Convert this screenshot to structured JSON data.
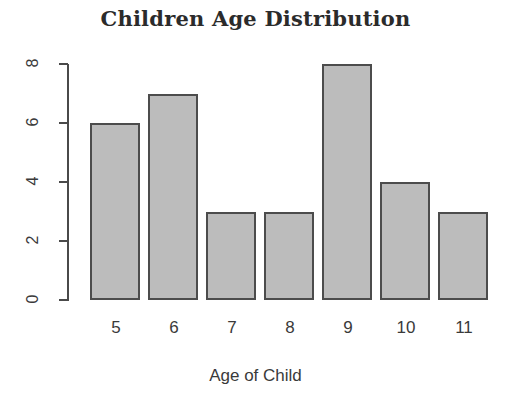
{
  "chart_data": {
    "type": "bar",
    "title": "Children Age Distribution",
    "xlabel": "Age of Child",
    "ylabel": "",
    "categories": [
      "5",
      "6",
      "7",
      "8",
      "9",
      "10",
      "11"
    ],
    "values": [
      6,
      7,
      3,
      3,
      8,
      4,
      3
    ],
    "ylim": [
      0,
      8
    ],
    "y_ticks": [
      "0",
      "2",
      "4",
      "6",
      "8"
    ],
    "y_tick_values": [
      0,
      2,
      4,
      6,
      8
    ],
    "grid": false,
    "legend": false,
    "bar_fill_color": "#bcbcbc",
    "bar_border_color": "#4c4c4c",
    "axis_color": "#4a4a4a",
    "background_color": "#ffffff"
  }
}
